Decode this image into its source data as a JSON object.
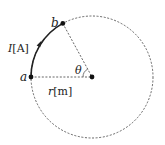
{
  "diagram": {
    "type": "circular-arc-current",
    "colors": {
      "background": "#ffffff",
      "stroke": "#222222",
      "dashed": "#555555"
    },
    "points": {
      "a": {
        "label": "a"
      },
      "b": {
        "label": "b"
      },
      "center": {
        "label": ""
      }
    },
    "labels": {
      "current_symbol": "I",
      "current_unit": "[A]",
      "radius_symbol": "r",
      "radius_unit": "[m]",
      "angle": "θ"
    }
  }
}
